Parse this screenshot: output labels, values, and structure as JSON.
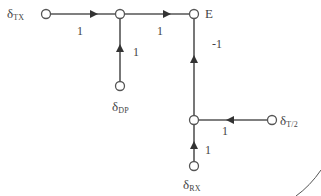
{
  "diagram": {
    "type": "signal-flow-graph",
    "colors": {
      "line": "#555555",
      "node_fill": "#ffffff",
      "text": "#444444"
    },
    "nodes": [
      {
        "id": "tx",
        "symbol": "δ",
        "subscript": "TX",
        "x": 46,
        "y": 14
      },
      {
        "id": "j1",
        "symbol": "",
        "subscript": "",
        "x": 120,
        "y": 14
      },
      {
        "id": "e",
        "symbol": "E",
        "subscript": "",
        "x": 194,
        "y": 14
      },
      {
        "id": "dp",
        "symbol": "δ",
        "subscript": "DP",
        "x": 120,
        "y": 86
      },
      {
        "id": "j2",
        "symbol": "",
        "subscript": "",
        "x": 194,
        "y": 120
      },
      {
        "id": "t2",
        "symbol": "δ",
        "subscript": "T/2",
        "x": 272,
        "y": 120
      },
      {
        "id": "rx",
        "symbol": "δ",
        "subscript": "RX",
        "x": 194,
        "y": 166
      }
    ],
    "edges": [
      {
        "from": "tx",
        "to": "j1",
        "gain": "1"
      },
      {
        "from": "j1",
        "to": "e",
        "gain": "1"
      },
      {
        "from": "dp",
        "to": "j1",
        "gain": "1"
      },
      {
        "from": "j2",
        "to": "e",
        "gain": "-1"
      },
      {
        "from": "t2",
        "to": "j2",
        "gain": "1"
      },
      {
        "from": "rx",
        "to": "j2",
        "gain": "1"
      }
    ]
  }
}
